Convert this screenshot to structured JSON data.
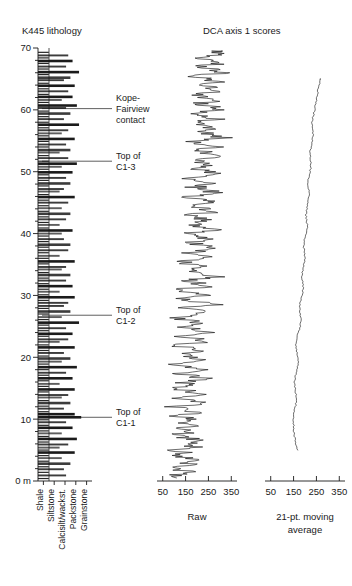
{
  "figure": {
    "panels": {
      "lithology": {
        "title": "K445 lithology",
        "y_axis": {
          "labels": [
            "70",
            "60",
            "50",
            "40",
            "30",
            "20",
            "10",
            "0 m"
          ],
          "values": [
            70,
            60,
            50,
            40,
            30,
            20,
            10,
            0
          ],
          "min": 0,
          "max": 70,
          "minor_step": 2,
          "unit": "m"
        },
        "x_axis": {
          "categories": [
            "Shale",
            "Siltstone",
            "Calcisilt/wackst.",
            "Packstone",
            "Grainstone"
          ],
          "orientation": "vertical-labels"
        },
        "annotations": [
          {
            "label_line1": "Kope-",
            "label_line2": "Fairview",
            "label_line3": "contact",
            "depth_m": 60.2
          },
          {
            "label_line1": "Top of",
            "label_line2": "C1-3",
            "depth_m": 51.7
          },
          {
            "label_line1": "Top of",
            "label_line2": "C1-2",
            "depth_m": 26.8
          },
          {
            "label_line1": "Top of",
            "label_line2": "C1-1",
            "depth_m": 10.3
          }
        ]
      },
      "dca": {
        "title": "DCA axis 1 scores",
        "subpanels": [
          {
            "name": "raw",
            "axis_label": "Raw",
            "tick_labels": [
              "50",
              "150",
              "250",
              "350"
            ],
            "tick_values": [
              50,
              150,
              250,
              350
            ],
            "xlim": [
              25,
              375
            ]
          },
          {
            "name": "moving-average",
            "axis_label_line1": "21-pt. moving",
            "axis_label_line2": "average",
            "tick_labels": [
              "50",
              "150",
              "250",
              "350"
            ],
            "tick_values": [
              50,
              150,
              250,
              350
            ],
            "xlim": [
              25,
              375
            ]
          }
        ]
      }
    },
    "colors": {
      "ink": "#1a1a1a",
      "curve": "#111111",
      "background": "#ffffff"
    }
  },
  "chart_data": {
    "type": "line",
    "ylabel": "Height (m)",
    "ylim": [
      0,
      70
    ],
    "grid": false,
    "legend": "none",
    "series": [
      {
        "name": "lithology",
        "type": "bar",
        "xlabel": "Lithology",
        "xlim": [
          0,
          5
        ],
        "xticklabels": [
          "Shale",
          "Siltstone",
          "Calcisilt/wackst.",
          "Packstone",
          "Grainstone"
        ],
        "comment": "horizontal bars: y = height in m, value = lithology class 1-5",
        "y": [
          0.4,
          0.9,
          1.4,
          1.9,
          2.3,
          2.8,
          3.2,
          3.7,
          4.1,
          4.6,
          5.0,
          5.4,
          5.9,
          6.3,
          6.8,
          7.2,
          7.7,
          8.1,
          8.6,
          9.0,
          9.5,
          9.9,
          10.3,
          10.8,
          11.2,
          11.7,
          12.1,
          12.6,
          13.0,
          13.5,
          13.9,
          14.4,
          14.8,
          15.3,
          15.7,
          16.2,
          16.6,
          17.1,
          17.5,
          18.0,
          18.4,
          18.9,
          19.3,
          19.8,
          20.2,
          20.7,
          21.1,
          21.6,
          22.0,
          22.5,
          22.9,
          23.4,
          23.8,
          24.3,
          24.7,
          25.2,
          25.6,
          26.1,
          26.5,
          27.0,
          27.4,
          27.9,
          28.3,
          28.8,
          29.2,
          29.7,
          30.1,
          30.6,
          31.0,
          31.5,
          31.9,
          32.4,
          32.8,
          33.3,
          33.7,
          34.2,
          34.6,
          35.1,
          35.5,
          36.0,
          36.4,
          36.9,
          37.3,
          37.8,
          38.2,
          38.7,
          39.1,
          39.6,
          40.0,
          40.5,
          40.9,
          41.4,
          41.8,
          42.3,
          42.7,
          43.2,
          43.6,
          44.1,
          44.5,
          45.0,
          45.4,
          45.9,
          46.3,
          46.8,
          47.2,
          47.7,
          48.1,
          48.6,
          49.0,
          49.5,
          49.9,
          50.4,
          50.8,
          51.3,
          51.7,
          52.2,
          52.6,
          53.1,
          53.5,
          54.0,
          54.4,
          54.9,
          55.3,
          55.8,
          56.2,
          56.7,
          57.1,
          57.6,
          58.0,
          58.5,
          58.9,
          59.4,
          59.8,
          60.3,
          60.7,
          61.2,
          61.6,
          62.1,
          62.5,
          63.0,
          63.4,
          63.9,
          64.3,
          64.8,
          65.2,
          65.7,
          66.1,
          66.6,
          67.0,
          67.5,
          67.9,
          68.4,
          68.8,
          69.3
        ],
        "values": [
          1.0,
          2.6,
          1.0,
          2.4,
          1.0,
          3.0,
          1.0,
          2.2,
          1.0,
          3.4,
          1.0,
          2.0,
          2.8,
          1.0,
          3.6,
          1.0,
          2.2,
          1.0,
          3.2,
          1.0,
          2.6,
          1.0,
          4.0,
          3.4,
          1.0,
          2.4,
          1.0,
          3.0,
          1.0,
          2.2,
          2.8,
          1.0,
          3.4,
          1.0,
          2.0,
          1.0,
          3.2,
          1.0,
          2.6,
          1.0,
          3.6,
          1.0,
          2.2,
          3.0,
          1.0,
          2.4,
          1.0,
          3.4,
          1.0,
          2.0,
          2.8,
          1.0,
          3.2,
          1.0,
          2.6,
          1.0,
          3.8,
          1.0,
          2.2,
          1.0,
          3.0,
          1.0,
          2.4,
          2.8,
          1.0,
          3.4,
          1.0,
          2.0,
          1.0,
          3.2,
          1.0,
          2.6,
          1.0,
          3.0,
          1.0,
          2.2,
          2.6,
          1.0,
          3.4,
          1.0,
          2.0,
          1.0,
          2.8,
          1.0,
          3.0,
          1.0,
          2.4,
          1.0,
          2.2,
          3.2,
          1.0,
          2.0,
          1.0,
          2.6,
          1.0,
          3.0,
          1.0,
          2.2,
          1.0,
          2.8,
          1.0,
          3.4,
          1.0,
          2.0,
          2.4,
          1.0,
          3.0,
          1.0,
          2.6,
          1.0,
          3.2,
          1.0,
          2.2,
          3.6,
          1.0,
          2.8,
          1.0,
          2.0,
          3.0,
          1.0,
          2.6,
          1.0,
          3.4,
          1.0,
          2.2,
          2.8,
          1.0,
          3.8,
          1.0,
          2.4,
          1.0,
          3.0,
          1.0,
          2.6,
          3.6,
          1.0,
          2.2,
          3.2,
          1.0,
          2.8,
          1.0,
          3.4,
          1.0,
          2.4,
          3.0,
          1.0,
          3.8,
          1.0,
          2.6,
          1.0,
          3.2,
          1.0,
          2.8,
          1.0,
          3.4,
          1.0,
          2.2
        ]
      },
      {
        "name": "DCA axis 1 raw",
        "type": "line",
        "xlabel": "Raw",
        "xlim": [
          25,
          375
        ],
        "comment": "x = DCA axis 1 score, y = height in m",
        "y": [
          0.5,
          1.0,
          1.5,
          2.0,
          2.5,
          3.0,
          3.5,
          4.0,
          4.5,
          5.0,
          5.5,
          6.0,
          6.5,
          7.0,
          7.5,
          8.0,
          8.5,
          9.0,
          9.5,
          10.0,
          10.5,
          11.0,
          11.5,
          12.0,
          12.5,
          13.0,
          13.5,
          14.0,
          14.5,
          15.0,
          15.5,
          16.0,
          16.5,
          17.0,
          17.5,
          18.0,
          18.5,
          19.0,
          19.5,
          20.0,
          20.5,
          21.0,
          21.5,
          22.0,
          22.5,
          23.0,
          23.5,
          24.0,
          24.5,
          25.0,
          25.5,
          26.0,
          26.5,
          27.0,
          27.5,
          28.0,
          28.5,
          29.0,
          29.5,
          30.0,
          30.5,
          31.0,
          31.5,
          32.0,
          32.5,
          33.0,
          33.5,
          34.0,
          34.5,
          35.0,
          35.5,
          36.0,
          36.5,
          37.0,
          37.5,
          38.0,
          38.5,
          39.0,
          39.5,
          40.0,
          40.5,
          41.0,
          41.5,
          42.0,
          42.5,
          43.0,
          43.5,
          44.0,
          44.5,
          45.0,
          45.5,
          46.0,
          46.5,
          47.0,
          47.5,
          48.0,
          48.5,
          49.0,
          49.5,
          50.0,
          50.5,
          51.0,
          51.5,
          52.0,
          52.5,
          53.0,
          53.5,
          54.0,
          54.5,
          55.0,
          55.5,
          56.0,
          56.5,
          57.0,
          57.5,
          58.0,
          58.5,
          59.0,
          59.5,
          60.0,
          60.5,
          61.0,
          61.5,
          62.0,
          62.5,
          63.0,
          63.5,
          64.0,
          64.5,
          65.0,
          65.5,
          66.0,
          66.5,
          67.0,
          67.5,
          68.0,
          68.5,
          69.0,
          69.5
        ],
        "values": [
          130,
          118,
          150,
          95,
          175,
          140,
          205,
          120,
          160,
          105,
          185,
          135,
          215,
          150,
          95,
          190,
          120,
          230,
          140,
          175,
          110,
          200,
          145,
          90,
          225,
          160,
          120,
          245,
          170,
          105,
          195,
          135,
          250,
          165,
          115,
          220,
          150,
          95,
          240,
          175,
          125,
          205,
          155,
          100,
          235,
          185,
          130,
          260,
          190,
          140,
          215,
          160,
          110,
          245,
          195,
          145,
          270,
          200,
          150,
          225,
          170,
          120,
          255,
          205,
          160,
          280,
          210,
          155,
          235,
          180,
          130,
          265,
          215,
          165,
          290,
          225,
          170,
          245,
          190,
          140,
          275,
          220,
          175,
          250,
          200,
          150,
          285,
          230,
          180,
          260,
          205,
          155,
          295,
          240,
          185,
          265,
          215,
          165,
          300,
          245,
          190,
          270,
          220,
          170,
          305,
          250,
          195,
          275,
          225,
          175,
          310,
          255,
          200,
          280,
          230,
          180,
          300,
          245,
          190,
          315,
          260,
          205,
          285,
          235,
          185,
          320,
          265,
          210,
          290,
          240,
          195,
          325,
          270,
          215,
          295,
          250,
          200,
          330,
          275
        ]
      },
      {
        "name": "DCA axis 1 21-pt moving average",
        "type": "line",
        "xlabel": "21-pt. moving average",
        "xlim": [
          25,
          375
        ],
        "comment": "x = smoothed DCA axis 1 score, y = height in m",
        "y": [
          5.0,
          6.0,
          7.0,
          8.0,
          9.0,
          10.0,
          11.0,
          12.0,
          13.0,
          14.0,
          15.0,
          16.0,
          17.0,
          18.0,
          19.0,
          20.0,
          21.0,
          22.0,
          23.0,
          24.0,
          25.0,
          26.0,
          27.0,
          28.0,
          29.0,
          30.0,
          31.0,
          32.0,
          33.0,
          34.0,
          35.0,
          36.0,
          37.0,
          38.0,
          39.0,
          40.0,
          41.0,
          42.0,
          43.0,
          44.0,
          45.0,
          46.0,
          47.0,
          48.0,
          49.0,
          50.0,
          51.0,
          52.0,
          53.0,
          54.0,
          55.0,
          56.0,
          57.0,
          58.0,
          59.0,
          60.0,
          61.0,
          62.0,
          63.0,
          64.0,
          65.0
        ],
        "values": [
          168,
          160,
          155,
          152,
          150,
          148,
          152,
          158,
          163,
          160,
          156,
          153,
          158,
          165,
          170,
          168,
          163,
          158,
          162,
          170,
          178,
          183,
          180,
          175,
          180,
          188,
          192,
          190,
          186,
          190,
          196,
          200,
          198,
          194,
          198,
          205,
          210,
          208,
          204,
          208,
          214,
          218,
          216,
          212,
          216,
          222,
          226,
          224,
          220,
          226,
          232,
          236,
          234,
          230,
          236,
          242,
          248,
          252,
          256,
          262,
          268
        ]
      }
    ]
  }
}
